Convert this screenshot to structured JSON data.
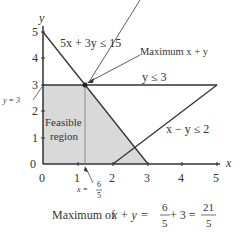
{
  "diagram": {
    "axes": {
      "x_label": "x",
      "y_label": "y",
      "x_ticks": [
        "0",
        "1",
        "2",
        "3",
        "4",
        "5"
      ],
      "y_ticks": [
        "0",
        "1",
        "2",
        "3",
        "4",
        "5"
      ]
    },
    "constraints": [
      {
        "label": "5x + 3y ≤ 15"
      },
      {
        "label": "y ≤ 3"
      },
      {
        "label": "x − y ≤ 2"
      }
    ],
    "region_label_line1": "Feasible",
    "region_label_line2": "region",
    "annotations": {
      "max_point": "Maximum x + y",
      "y_eq": "y = 3",
      "x_eq_prefix": "x =",
      "x_eq_num": "6",
      "x_eq_den": "5"
    },
    "caption": {
      "prefix": "Maximum of ",
      "expr": "x + y",
      "eq1": " = ",
      "f1_num": "6",
      "f1_den": "5",
      "plus": " + 3 = ",
      "f2_num": "21",
      "f2_den": "5"
    },
    "colors": {
      "region_fill": "#d9d9d9",
      "line": "#333333"
    }
  }
}
